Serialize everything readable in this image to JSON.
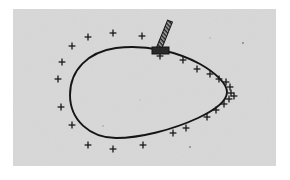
{
  "figure": {
    "caption": "",
    "canvas": {
      "width": 290,
      "height": 180
    },
    "background_color": "#ffffff",
    "panel": {
      "label": "scan-panel",
      "x": 13,
      "y": 9,
      "width": 263,
      "height": 157,
      "fill_color": "#d8d8d8",
      "noise": "paper-grain"
    },
    "contour": {
      "label": "closed teardrop curve",
      "stroke_color": "#151515",
      "stroke_width": 1.9,
      "fill": "none",
      "extents": {
        "left_x": 70,
        "right_x": 227,
        "top_y": 48,
        "bottom_y": 138
      },
      "path": "M 70 95 C 70 70, 88 52, 116 48 C 146 44, 178 52, 200 64 C 216 73, 227 84, 227 92 C 227 101, 215 110, 198 118 C 172 130, 140 138, 116 138 C 90 138, 70 120, 70 95 Z"
    },
    "probe": {
      "label": "hatched probe rod with base plate",
      "stroke_color": "#151515",
      "body_fill": "#9a9a9a",
      "base_fill": "#2a2a2a",
      "rod": {
        "x1": 171,
        "y1": 22,
        "x2": 160,
        "y2": 48,
        "width": 5
      },
      "base_plate": {
        "x": 152,
        "y": 47,
        "width": 17,
        "height": 7
      },
      "hatch_count": 9
    },
    "markers": {
      "label": "plus-sign sample markers",
      "glyph": "plus",
      "color": "#1a1a1a",
      "arm_length": 3.4,
      "stroke_width": 1.3,
      "count": 26,
      "points": [
        {
          "x": 88,
          "y": 37
        },
        {
          "x": 113,
          "y": 33
        },
        {
          "x": 142,
          "y": 36
        },
        {
          "x": 72,
          "y": 46
        },
        {
          "x": 62,
          "y": 62
        },
        {
          "x": 58,
          "y": 79
        },
        {
          "x": 61,
          "y": 107
        },
        {
          "x": 72,
          "y": 125
        },
        {
          "x": 88,
          "y": 145
        },
        {
          "x": 113,
          "y": 149
        },
        {
          "x": 143,
          "y": 145
        },
        {
          "x": 173,
          "y": 133
        },
        {
          "x": 186,
          "y": 128
        },
        {
          "x": 207,
          "y": 117
        },
        {
          "x": 216,
          "y": 110
        },
        {
          "x": 224,
          "y": 104
        },
        {
          "x": 229,
          "y": 99
        },
        {
          "x": 231,
          "y": 93
        },
        {
          "x": 230,
          "y": 87
        },
        {
          "x": 226,
          "y": 82
        },
        {
          "x": 219,
          "y": 79
        },
        {
          "x": 210,
          "y": 74
        },
        {
          "x": 197,
          "y": 69
        },
        {
          "x": 183,
          "y": 60
        },
        {
          "x": 160,
          "y": 56
        },
        {
          "x": 234,
          "y": 96
        }
      ]
    },
    "specks": {
      "label": "faint scan specks",
      "color": "#8a8a8a",
      "points": [
        {
          "x": 243,
          "y": 43,
          "r": 1.1
        },
        {
          "x": 190,
          "y": 147,
          "r": 1.0
        },
        {
          "x": 103,
          "y": 126,
          "r": 0.8
        },
        {
          "x": 210,
          "y": 38,
          "r": 0.7
        },
        {
          "x": 140,
          "y": 100,
          "r": 0.6
        }
      ]
    }
  }
}
